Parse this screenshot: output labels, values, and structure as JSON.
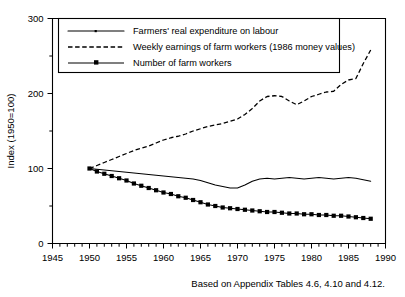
{
  "chart_data": {
    "type": "line",
    "title": "",
    "subtitle": "",
    "xlabel": "",
    "ylabel": "Index (1950=100)",
    "xlim": [
      1945,
      1990
    ],
    "ylim": [
      0,
      300
    ],
    "xticks": [
      1945,
      1950,
      1955,
      1960,
      1965,
      1970,
      1975,
      1980,
      1985,
      1990
    ],
    "xticklabels": [
      "1945",
      "1950",
      "1955",
      "1960",
      "1965",
      "1970",
      "1975",
      "1980",
      "1985",
      "1990"
    ],
    "xminor_step": 1,
    "yticks": [
      0,
      100,
      200,
      300
    ],
    "yticklabels": [
      "0",
      "100",
      "200",
      "300"
    ],
    "yminor_ticks": [
      50,
      150,
      250
    ],
    "grid": false,
    "legend_position": "upper-left-inside",
    "annotation": "Based on Appendix Tables 4.6, 4.10 and 4.12.",
    "x": [
      1950,
      1951,
      1952,
      1953,
      1954,
      1955,
      1956,
      1957,
      1958,
      1959,
      1960,
      1961,
      1962,
      1963,
      1964,
      1965,
      1966,
      1967,
      1968,
      1969,
      1970,
      1971,
      1972,
      1973,
      1974,
      1975,
      1976,
      1977,
      1978,
      1979,
      1980,
      1981,
      1982,
      1983,
      1984,
      1985,
      1986,
      1987,
      1988
    ],
    "series": [
      {
        "name": "Farmers' real expenditure on labour",
        "style": "solid",
        "marker": "none",
        "values": [
          100,
          99,
          98,
          97,
          96,
          95,
          94,
          93,
          92,
          91,
          90,
          89,
          88,
          87,
          86,
          84,
          81,
          78,
          76,
          74,
          74,
          78,
          83,
          86,
          87,
          86,
          87,
          88,
          87,
          86,
          87,
          88,
          87,
          86,
          87,
          88,
          87,
          85,
          83
        ]
      },
      {
        "name": "Weekly earnings of farm workers (1986 money values)",
        "style": "dashed",
        "marker": "none",
        "values": [
          100,
          104,
          108,
          112,
          116,
          120,
          124,
          127,
          130,
          134,
          138,
          141,
          143,
          146,
          150,
          153,
          156,
          158,
          160,
          163,
          166,
          172,
          180,
          190,
          196,
          197,
          196,
          190,
          185,
          190,
          196,
          199,
          202,
          203,
          212,
          218,
          220,
          240,
          258
        ]
      },
      {
        "name": "Number of farm workers",
        "style": "solid",
        "marker": "square",
        "values": [
          100,
          96,
          93,
          90,
          87,
          84,
          80,
          77,
          74,
          71,
          68,
          66,
          63,
          61,
          58,
          55,
          52,
          50,
          48,
          47,
          46,
          45,
          44,
          43,
          42,
          42,
          41,
          40,
          40,
          39,
          39,
          38,
          38,
          37,
          37,
          36,
          35,
          34,
          33
        ]
      }
    ]
  },
  "legend": {
    "entries": [
      {
        "label": "Farmers' real expenditure on labour",
        "style": "solid"
      },
      {
        "label": "Weekly earnings of farm workers (1986 money values)",
        "style": "dashed"
      },
      {
        "label": "Number of farm workers",
        "style": "solid-marker"
      }
    ]
  },
  "caption": {
    "text": "Based on Appendix Tables 4.6, 4.10 and 4.12."
  },
  "colors": {
    "ink": "#000000",
    "paper": "#ffffff"
  }
}
